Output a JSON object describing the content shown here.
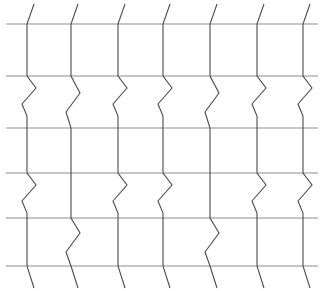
{
  "figure": {
    "width": 323,
    "height": 291,
    "background_color": "#ffffff"
  },
  "chart_data": {
    "type": "line",
    "subtitle": "",
    "xlabel": "",
    "ylabel": "",
    "xlim": [
      0,
      323
    ],
    "ylim": [
      0,
      291
    ],
    "grid": false,
    "legend": "none",
    "horizontal_lines": {
      "color": "#8c8c8c",
      "stroke_width": 1.15,
      "x_start": 6,
      "x_end": 318,
      "y_values": [
        24,
        76,
        128,
        173,
        218,
        266
      ]
    },
    "vertical_lines": {
      "color": "#4a4a4a",
      "stroke_width": 1.1,
      "y_start": 4,
      "y_end": 288,
      "base_x_values": [
        27,
        71,
        118,
        163,
        210,
        257,
        303
      ],
      "zigzag_amplitude": 17,
      "phase_by_column": [
        "odd",
        "even",
        "odd",
        "odd",
        "even",
        "odd",
        "odd"
      ],
      "paths": [
        "M 34 4 L 27 24 L 27 76 L 36 88 L 22 104 L 27 116 L 27 128 L 27 173 L 36 185 L 22 201 L 27 213 L 27 218 L 27 266 L 34 288",
        "M 78 4 L 71 24 L 71 76 L 80 93 L 66 112 L 71 128 L 71 134 L 71 173 L 71 218 L 80 233 L 66 252 L 71 266 L 78 288",
        "M 125 4 L 118 24 L 118 76 L 127 88 L 113 104 L 118 116 L 118 128 L 118 173 L 127 185 L 113 201 L 118 213 L 118 218 L 118 266 L 125 288",
        "M 170 4 L 163 24 L 163 76 L 172 88 L 158 104 L 163 116 L 163 128 L 163 173 L 172 185 L 158 201 L 163 213 L 163 218 L 163 266 L 170 288",
        "M 217 4 L 210 24 L 210 76 L 219 93 L 205 112 L 210 128 L 210 134 L 210 173 L 210 218 L 219 233 L 205 252 L 210 266 L 217 288",
        "M 264 4 L 257 24 L 257 76 L 266 88 L 252 104 L 257 116 L 257 128 L 257 173 L 266 185 L 252 201 L 257 213 L 257 218 L 257 266 L 264 288",
        "M 310 4 L 303 24 L 303 76 L 312 88 L 298 104 L 303 116 L 303 128 L 303 173 L 312 185 L 298 201 L 303 213 L 303 218 L 303 266 L 310 288"
      ]
    }
  }
}
